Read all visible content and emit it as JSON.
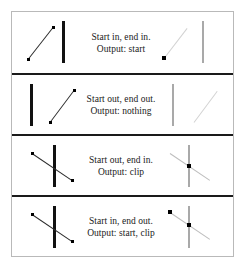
{
  "figure": {
    "kind": "line-clipping-cases-diagram",
    "rows": [
      {
        "id": "case-start-in-end-in",
        "caption_line1": "Start in, end in.",
        "caption_line2": "Output: start",
        "before": {
          "boundary": {
            "x": 46,
            "label": "clip-boundary"
          },
          "segment": {
            "x1": 12,
            "y1": 47,
            "x2": 37,
            "y2": 15
          },
          "segment_color": "#2b2b2b",
          "dots": [
            {
              "x": 12,
              "y": 47,
              "size": "small"
            },
            {
              "x": 37,
              "y": 15,
              "size": "small"
            }
          ]
        },
        "after": {
          "boundary": {
            "x": 40,
            "label": "clip-boundary"
          },
          "segment": {
            "x1": 2,
            "y1": 46,
            "x2": 25,
            "y2": 16
          },
          "segment_color": "#d2d2d2",
          "dots": [
            {
              "x": 2,
              "y": 46,
              "size": "big"
            }
          ]
        }
      },
      {
        "id": "case-start-out-end-out",
        "caption_line1": "Start out, end out.",
        "caption_line2": "Output: nothing",
        "before": {
          "boundary": {
            "x": 14,
            "label": "clip-boundary"
          },
          "segment": {
            "x1": 34,
            "y1": 47,
            "x2": 58,
            "y2": 15
          },
          "segment_color": "#2b2b2b",
          "dots": [
            {
              "x": 34,
              "y": 47,
              "size": "small"
            },
            {
              "x": 58,
              "y": 15,
              "size": "small"
            }
          ]
        },
        "after": {
          "boundary": {
            "x": 10,
            "label": "clip-boundary"
          },
          "segment": {
            "x1": 32,
            "y1": 47,
            "x2": 55,
            "y2": 16
          },
          "segment_color": "#d2d2d2",
          "dots": []
        }
      },
      {
        "id": "case-start-out-end-in",
        "caption_line1": "Start out, end in.",
        "caption_line2": "Output: clip",
        "before": {
          "boundary": {
            "x": 37,
            "label": "clip-boundary"
          },
          "segment": {
            "x1": 16,
            "y1": 17,
            "x2": 56,
            "y2": 44
          },
          "segment_color": "#2b2b2b",
          "dots": [
            {
              "x": 16,
              "y": 17,
              "size": "small"
            },
            {
              "x": 56,
              "y": 44,
              "size": "small"
            }
          ]
        },
        "after": {
          "boundary": {
            "x": 26,
            "label": "clip-boundary"
          },
          "segment": {
            "x1": 8,
            "y1": 17,
            "x2": 48,
            "y2": 44
          },
          "segment_color": "#bdbdbd",
          "dots": [
            {
              "x": 27,
              "y": 30,
              "size": "big"
            }
          ]
        }
      },
      {
        "id": "case-start-in-end-out",
        "caption_line1": "Start in, end out.",
        "caption_line2": "Output: start, clip",
        "before": {
          "boundary": {
            "x": 37,
            "label": "clip-boundary"
          },
          "segment": {
            "x1": 16,
            "y1": 17,
            "x2": 56,
            "y2": 44
          },
          "segment_color": "#2b2b2b",
          "dots": [
            {
              "x": 16,
              "y": 17,
              "size": "small"
            },
            {
              "x": 56,
              "y": 44,
              "size": "small"
            }
          ]
        },
        "after": {
          "boundary": {
            "x": 26,
            "label": "clip-boundary"
          },
          "segment": {
            "x1": 8,
            "y1": 15,
            "x2": 48,
            "y2": 42
          },
          "segment_color": "#bdbdbd",
          "dots": [
            {
              "x": 8,
              "y": 15,
              "size": "big"
            },
            {
              "x": 27,
              "y": 28,
              "size": "big"
            }
          ]
        }
      }
    ]
  },
  "colors": {
    "frame_border": "#b9b9b9",
    "row_divider": "#1a1a1a",
    "boundary_active": "#111111",
    "boundary_result": "#a9a9a9",
    "segment_active": "#2b2b2b",
    "segment_result": "#d2d2d2",
    "dot": "#000000",
    "text": "#1a1a1a",
    "background": "#ffffff"
  }
}
